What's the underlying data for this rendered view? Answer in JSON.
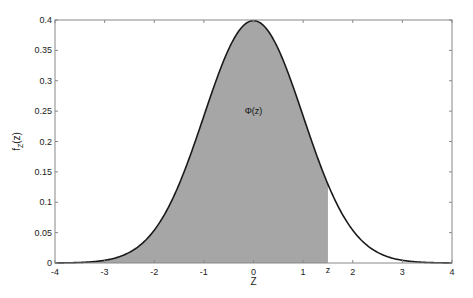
{
  "chart_data": {
    "type": "area",
    "title": "",
    "xlabel": "Z",
    "ylabel": "f_Z(z)",
    "ylabel_main": "f",
    "ylabel_sub": "Z",
    "ylabel_arg": "(z)",
    "xlim": [
      -4,
      4
    ],
    "ylim": [
      0,
      0.4
    ],
    "grid": false,
    "legend": null,
    "x_ticks": [
      -4,
      -3,
      -2,
      -1,
      0,
      1,
      2,
      3,
      4
    ],
    "x_tick_labels": [
      "-4",
      "-3",
      "-2",
      "-1",
      "0",
      "1",
      "2",
      "3",
      "4"
    ],
    "y_ticks": [
      0,
      0.05,
      0.1,
      0.15,
      0.2,
      0.25,
      0.3,
      0.35,
      0.4
    ],
    "y_tick_labels": [
      "0",
      "0.05",
      "0.1",
      "0.15",
      "0.2",
      "0.25",
      "0.3",
      "0.35",
      "0.4"
    ],
    "series": [
      {
        "name": "standard normal pdf",
        "function": "exp(-z^2/2)/sqrt(2*pi)",
        "x": [
          -4,
          -3.5,
          -3,
          -2.5,
          -2,
          -1.5,
          -1,
          -0.5,
          0,
          0.5,
          1,
          1.5,
          2,
          2.5,
          3,
          3.5,
          4
        ],
        "values": [
          0.0001,
          0.0009,
          0.0044,
          0.0175,
          0.054,
          0.1295,
          0.242,
          0.3521,
          0.3989,
          0.3521,
          0.242,
          0.1295,
          0.054,
          0.0175,
          0.0044,
          0.0009,
          0.0001
        ],
        "color": "#1a1a1a"
      }
    ],
    "shaded_region": {
      "from": -4,
      "to": 1.5,
      "color": "#a6a6a6",
      "label": "Φ(z)",
      "label_position": {
        "x": 0,
        "y": 0.25
      }
    },
    "annotations": [
      {
        "text": "Φ(z)",
        "x": 0,
        "y": 0.25
      },
      {
        "text": "z",
        "x": 1.5,
        "y": 0,
        "position": "below-axis"
      }
    ]
  }
}
